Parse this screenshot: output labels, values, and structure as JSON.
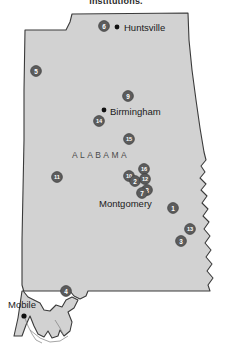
{
  "figure": {
    "caption": "institutions.",
    "state_label": "ALABAMA",
    "colors": {
      "state_fill": "#d2d2d2",
      "state_outline": "#3a3a3a",
      "marker_fill": "#5c5c5c",
      "marker_text": "#ffffff",
      "city_dot": "#111111",
      "background": "#ffffff"
    }
  },
  "cities": [
    {
      "name": "Huntsville",
      "dot_x": 117,
      "dot_y": 27,
      "label_x": 124,
      "label_y": 31
    },
    {
      "name": "Birmingham",
      "dot_x": 104,
      "dot_y": 110,
      "label_x": 110,
      "label_y": 115
    },
    {
      "name": "Montgomery",
      "dot_x": 140,
      "dot_y": 193,
      "label_x": 99,
      "label_y": 207
    },
    {
      "name": "Mobile",
      "dot_x": 24,
      "dot_y": 316,
      "label_x": 8,
      "label_y": 308
    }
  ],
  "markers": [
    {
      "id": "6",
      "x": 104,
      "y": 26
    },
    {
      "id": "5",
      "x": 36,
      "y": 71
    },
    {
      "id": "9",
      "x": 128,
      "y": 96
    },
    {
      "id": "14",
      "x": 99,
      "y": 121
    },
    {
      "id": "15",
      "x": 129,
      "y": 139
    },
    {
      "id": "11",
      "x": 57,
      "y": 177
    },
    {
      "id": "16",
      "x": 144,
      "y": 169
    },
    {
      "id": "10",
      "x": 129,
      "y": 176
    },
    {
      "id": "2",
      "x": 135,
      "y": 181
    },
    {
      "id": "12",
      "x": 145,
      "y": 179
    },
    {
      "id": "8",
      "x": 147,
      "y": 190
    },
    {
      "id": "7",
      "x": 142,
      "y": 193
    },
    {
      "id": "1",
      "x": 173,
      "y": 208
    },
    {
      "id": "13",
      "x": 190,
      "y": 229
    },
    {
      "id": "3",
      "x": 181,
      "y": 241
    },
    {
      "id": "4",
      "x": 66,
      "y": 291
    }
  ]
}
